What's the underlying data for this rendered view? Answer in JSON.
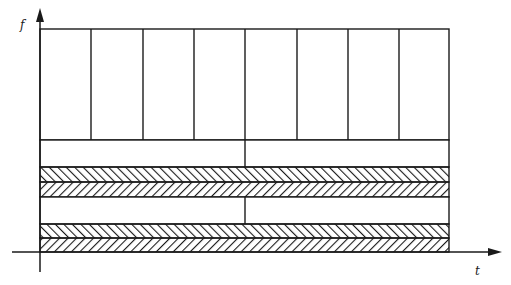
{
  "axes": {
    "y_label": "f",
    "x_label": "t",
    "origin": [
      40,
      252
    ],
    "y_axis": {
      "x": 40,
      "top": 8,
      "bottom": 272
    },
    "x_axis": {
      "y": 252,
      "left": 12,
      "right": 502
    }
  },
  "colors": {
    "line": "#1a1a1a",
    "background": "#ffffff"
  },
  "frame": {
    "left": 40,
    "right": 449,
    "top": 29
  },
  "regions": [
    {
      "name": "tall-cells",
      "top": 29,
      "bottom": 140,
      "fill": "none",
      "dividers": [
        91,
        143,
        194,
        245,
        297,
        348,
        399
      ]
    },
    {
      "name": "wide-cells-1",
      "top": 140,
      "bottom": 167,
      "fill": "none",
      "dividers": [
        245
      ]
    },
    {
      "name": "hatch-band-1a",
      "top": 167,
      "bottom": 182,
      "fill": "hatch-back",
      "dividers": []
    },
    {
      "name": "hatch-band-1b",
      "top": 182,
      "bottom": 197,
      "fill": "hatch-fwd",
      "dividers": []
    },
    {
      "name": "wide-cells-2",
      "top": 197,
      "bottom": 224,
      "fill": "none",
      "dividers": [
        245
      ]
    },
    {
      "name": "hatch-band-2a",
      "top": 224,
      "bottom": 238,
      "fill": "hatch-back",
      "dividers": []
    },
    {
      "name": "hatch-band-2b",
      "top": 238,
      "bottom": 252,
      "fill": "hatch-fwd",
      "dividers": []
    }
  ]
}
